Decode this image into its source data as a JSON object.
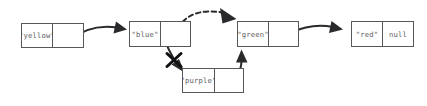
{
  "diagram": {
    "background_color": "#ffffff",
    "box_border_color": "#58585a",
    "text_color": "#5d5d60",
    "arrow_color": "#2a2a2c",
    "cross_color": "#111113",
    "nodes": [
      {
        "id": "yellow",
        "data_label": "\"yellow\"",
        "next_label": "",
        "x": 21,
        "y": 23,
        "w": 63,
        "h": 25,
        "split": 32
      },
      {
        "id": "blue",
        "data_label": "\"blue\"",
        "next_label": "",
        "x": 129,
        "y": 21,
        "w": 62,
        "h": 26,
        "split": 32
      },
      {
        "id": "green",
        "data_label": "\"green\"",
        "next_label": "",
        "x": 237,
        "y": 21,
        "w": 62,
        "h": 26,
        "split": 32
      },
      {
        "id": "red",
        "data_label": "\"red\"",
        "next_label": "null",
        "x": 351,
        "y": 21,
        "w": 63,
        "h": 26,
        "split": 32
      },
      {
        "id": "purple",
        "data_label": "\"purple\"",
        "next_label": "",
        "x": 182,
        "y": 68,
        "w": 62,
        "h": 25,
        "split": 33
      }
    ],
    "edges": [
      {
        "id": "yellow-to-blue",
        "from": "yellow",
        "to": "blue",
        "style": "solid",
        "state": "active"
      },
      {
        "id": "blue-to-purple",
        "from": "blue",
        "to": "purple",
        "style": "solid",
        "state": "removed"
      },
      {
        "id": "blue-to-green",
        "from": "blue",
        "to": "green",
        "style": "dashed",
        "state": "new"
      },
      {
        "id": "purple-to-green",
        "from": "purple",
        "to": "green",
        "style": "solid",
        "state": "active"
      },
      {
        "id": "green-to-red",
        "from": "green",
        "to": "red",
        "style": "solid",
        "state": "active"
      }
    ],
    "cross_mark": {
      "id": "blue-to-purple-cross",
      "label": "X",
      "cx": 174,
      "cy": 60,
      "size": 9
    }
  }
}
